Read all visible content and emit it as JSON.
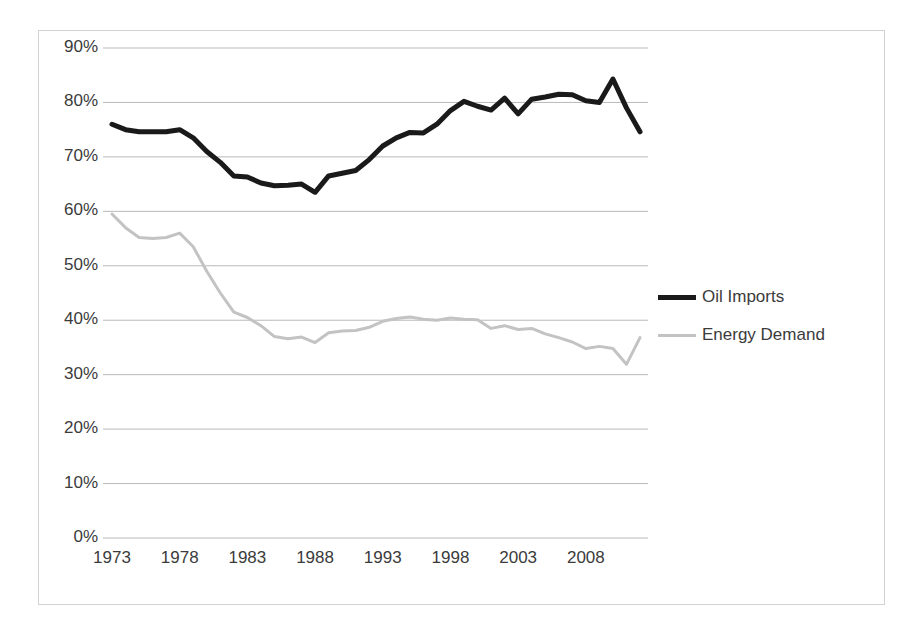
{
  "chart_data": {
    "type": "line",
    "title": "",
    "subtitle": "",
    "xlabel": "",
    "ylabel": "",
    "xlim": [
      1973,
      2012
    ],
    "ylim": [
      0,
      0.9
    ],
    "grid": "horizontal",
    "legend_position": "right",
    "y_ticks": [
      "0%",
      "10%",
      "20%",
      "30%",
      "40%",
      "50%",
      "60%",
      "70%",
      "80%",
      "90%"
    ],
    "y_tick_values": [
      0,
      10,
      20,
      30,
      40,
      50,
      60,
      70,
      80,
      90
    ],
    "x_ticks": [
      "1973",
      "1978",
      "1983",
      "1988",
      "1993",
      "1998",
      "2003",
      "2008"
    ],
    "x_tick_values": [
      1973,
      1978,
      1983,
      1988,
      1993,
      1998,
      2003,
      2008
    ],
    "x": [
      1973,
      1974,
      1975,
      1976,
      1977,
      1978,
      1979,
      1980,
      1981,
      1982,
      1983,
      1984,
      1985,
      1986,
      1987,
      1988,
      1989,
      1990,
      1991,
      1992,
      1993,
      1994,
      1995,
      1996,
      1997,
      1998,
      1999,
      2000,
      2001,
      2002,
      2003,
      2004,
      2005,
      2006,
      2007,
      2008,
      2009,
      2010,
      2011,
      2012
    ],
    "series": [
      {
        "name": "Oil Imports",
        "color": "#1a1a1a",
        "width": 5,
        "values": [
          76.0,
          75.0,
          74.6,
          74.6,
          74.6,
          75.0,
          73.5,
          71.0,
          69.0,
          66.5,
          66.3,
          65.2,
          64.7,
          64.8,
          65.0,
          63.5,
          66.5,
          67.0,
          67.5,
          69.5,
          72.0,
          73.5,
          74.5,
          74.4,
          76.0,
          78.5,
          80.2,
          79.3,
          78.6,
          80.8,
          77.9,
          80.6,
          81.0,
          81.5,
          81.4,
          80.3,
          80.0,
          84.3,
          79.0,
          74.6
        ]
      },
      {
        "name": "Energy Demand",
        "color": "#c3c3c3",
        "width": 3,
        "values": [
          59.5,
          57.0,
          55.2,
          55.0,
          55.2,
          56.0,
          53.5,
          49.0,
          45.0,
          41.5,
          40.5,
          39.0,
          37.0,
          36.6,
          36.9,
          35.9,
          37.7,
          38.0,
          38.1,
          38.7,
          39.8,
          40.3,
          40.6,
          40.2,
          40.0,
          40.4,
          40.2,
          40.1,
          38.5,
          39.0,
          38.3,
          38.5,
          37.5,
          36.8,
          36.0,
          34.8,
          35.2,
          34.8,
          31.9,
          36.8
        ]
      }
    ]
  },
  "legend": {
    "items": [
      {
        "label": "Oil Imports",
        "swatch": "oil-line-swatch"
      },
      {
        "label": "Energy Demand",
        "swatch": "energy-line-swatch"
      }
    ]
  },
  "colors": {
    "oil_imports": "#1a1a1a",
    "energy_demand": "#c3c3c3",
    "gridline": "#b9b9b9",
    "frame_border": "#d2d2d2",
    "text": "#3b3b3b",
    "background": "#ffffff"
  }
}
